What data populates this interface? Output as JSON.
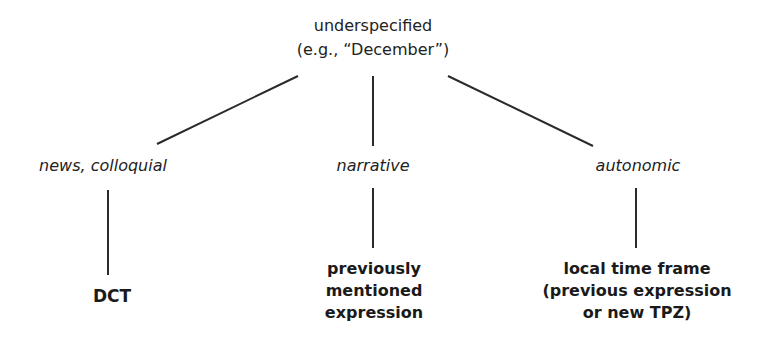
{
  "diagram": {
    "root": {
      "line1": "underspecified",
      "line2": "(e.g., “December”)"
    },
    "categories": [
      {
        "label": "news, colloquial"
      },
      {
        "label": "narrative"
      },
      {
        "label": "autonomic"
      }
    ],
    "leaves": [
      {
        "lines": [
          "DCT"
        ]
      },
      {
        "lines": [
          "previously",
          "mentioned",
          "expression"
        ]
      },
      {
        "lines": [
          "local time frame",
          "(previous expression",
          "or new TPZ)"
        ]
      }
    ],
    "edges": [
      {
        "from": "root",
        "to": "news, colloquial"
      },
      {
        "from": "root",
        "to": "narrative"
      },
      {
        "from": "root",
        "to": "autonomic"
      },
      {
        "from": "news, colloquial",
        "to": "DCT"
      },
      {
        "from": "narrative",
        "to": "previously mentioned expression"
      },
      {
        "from": "autonomic",
        "to": "local time frame (previous expression or new TPZ)"
      }
    ],
    "line_color": "#2a2a2a",
    "background_color": "#ffffff"
  }
}
